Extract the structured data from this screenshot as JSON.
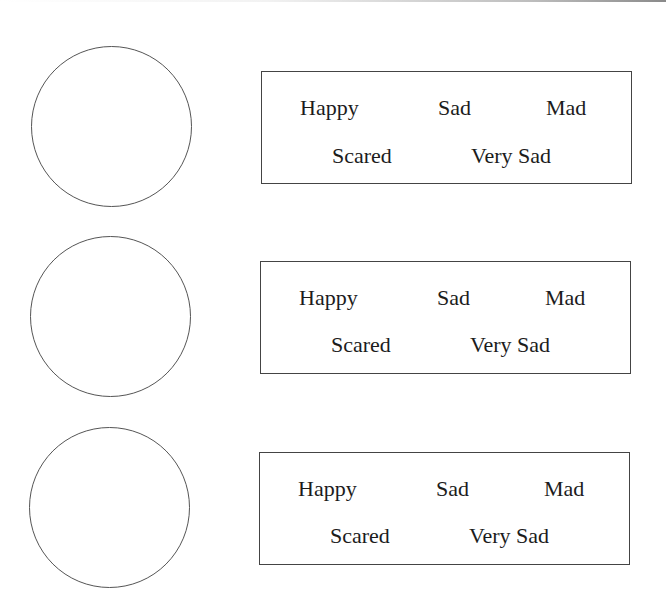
{
  "worksheet": {
    "rows": [
      {
        "face": {
          "shape": "circle",
          "filled": false
        },
        "options": {
          "top": [
            "Happy",
            "Sad",
            "Mad"
          ],
          "bottom": [
            "Scared",
            "Very Sad"
          ]
        }
      },
      {
        "face": {
          "shape": "circle",
          "filled": false
        },
        "options": {
          "top": [
            "Happy",
            "Sad",
            "Mad"
          ],
          "bottom": [
            "Scared",
            "Very Sad"
          ]
        }
      },
      {
        "face": {
          "shape": "circle",
          "filled": false
        },
        "options": {
          "top": [
            "Happy",
            "Sad",
            "Mad"
          ],
          "bottom": [
            "Scared",
            "Very Sad"
          ]
        }
      }
    ]
  },
  "colors": {
    "background": "#ffffff",
    "line": "#444444",
    "text": "#1c1c1c"
  }
}
